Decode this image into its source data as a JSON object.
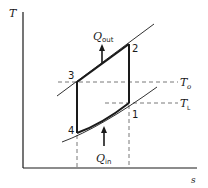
{
  "diagram": {
    "type": "T-s diagram (refrigeration / heat pump cycle)",
    "axes": {
      "y_label": "T",
      "x_label": "s"
    },
    "points": [
      {
        "id": "1",
        "label": "1"
      },
      {
        "id": "2",
        "label": "2"
      },
      {
        "id": "3",
        "label": "3"
      },
      {
        "id": "4",
        "label": "4"
      }
    ],
    "heat_flows": {
      "out": {
        "symbol": "Q",
        "subscript": "out"
      },
      "in": {
        "symbol": "Q",
        "subscript": "in"
      }
    },
    "temperature_levels": {
      "high": {
        "symbol": "T",
        "subscript": "o"
      },
      "low": {
        "symbol": "T",
        "subscript": "L"
      }
    },
    "colors": {
      "line": "#1a1a1a",
      "dashed": "#555555",
      "background": "#ffffff"
    }
  }
}
